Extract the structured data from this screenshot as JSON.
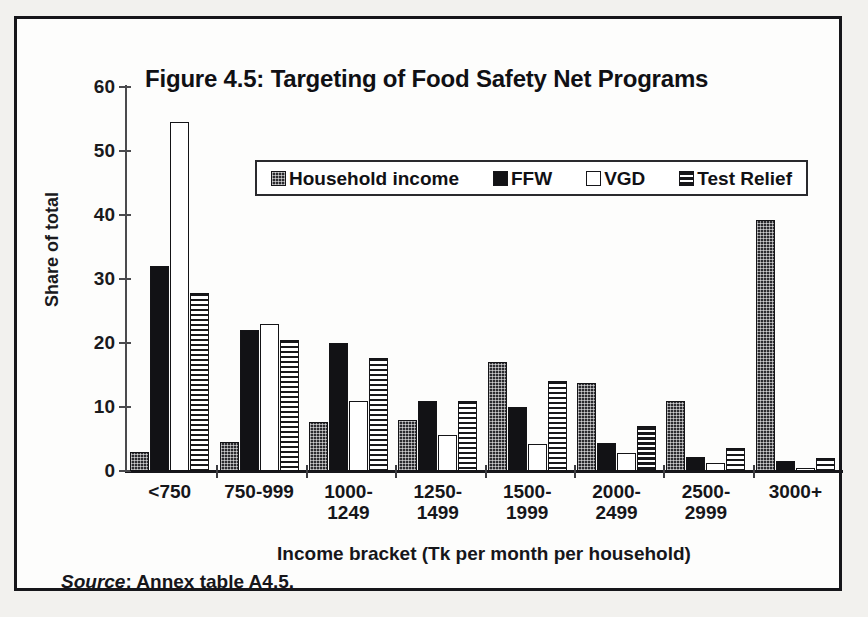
{
  "figure": {
    "title": "Figure 4.5: Targeting of Food Safety Net Programs",
    "y_axis_title": "Share of total",
    "x_axis_title": "Income bracket (Tk per month per household)",
    "source_word": "Source",
    "source_rest": ": Annex table A4.5."
  },
  "legend": {
    "items": [
      {
        "label": "Household income",
        "swatch": "dotted-swatch-icon",
        "pattern": "fill-dots"
      },
      {
        "label": "FFW",
        "swatch": "solid-black-swatch-icon",
        "pattern": "fill-solid"
      },
      {
        "label": "VGD",
        "swatch": "white-swatch-icon",
        "pattern": "fill-white"
      },
      {
        "label": "Test Relief",
        "swatch": "horizontal-lines-swatch-icon",
        "pattern": "fill-hlines"
      }
    ]
  },
  "axes": {
    "y_ticks": [
      0,
      10,
      20,
      30,
      40,
      50,
      60
    ],
    "y_min": 0,
    "y_max": 60
  },
  "chart_data": {
    "type": "bar",
    "title": "Figure 4.5: Targeting of Food Safety Net Programs",
    "xlabel": "Income bracket (Tk per month per household)",
    "ylabel": "Share of total",
    "ylim": [
      0,
      60
    ],
    "ytick_step": 10,
    "grid": false,
    "legend_position": "inside-top-center",
    "source": "Source: Annex table A4.5.",
    "categories": [
      "<750",
      "750-999",
      "1000-\n1249",
      "1250-\n1499",
      "1500-\n1999",
      "2000-\n2499",
      "2500-\n2999",
      "3000+"
    ],
    "category_lines": [
      [
        "<750"
      ],
      [
        "750-999"
      ],
      [
        "1000-",
        "1249"
      ],
      [
        "1250-",
        "1499"
      ],
      [
        "1500-",
        "1999"
      ],
      [
        "2000-",
        "2499"
      ],
      [
        "2500-",
        "2999"
      ],
      [
        "3000+"
      ]
    ],
    "series": [
      {
        "name": "Household income",
        "pattern": "fill-dots",
        "values": [
          3.0,
          4.5,
          7.7,
          8.0,
          17.0,
          13.8,
          11.0,
          39.2
        ]
      },
      {
        "name": "FFW",
        "pattern": "fill-solid",
        "values": [
          32.0,
          22.0,
          20.0,
          11.0,
          10.0,
          4.3,
          2.2,
          1.5
        ]
      },
      {
        "name": "VGD",
        "pattern": "fill-white",
        "values": [
          54.5,
          23.0,
          11.0,
          5.7,
          4.2,
          2.8,
          1.2,
          0.2
        ]
      },
      {
        "name": "Test Relief",
        "pattern": "fill-hlines",
        "values": [
          27.8,
          20.5,
          17.7,
          11.0,
          14.0,
          7.1,
          3.6,
          2.0
        ]
      }
    ]
  }
}
